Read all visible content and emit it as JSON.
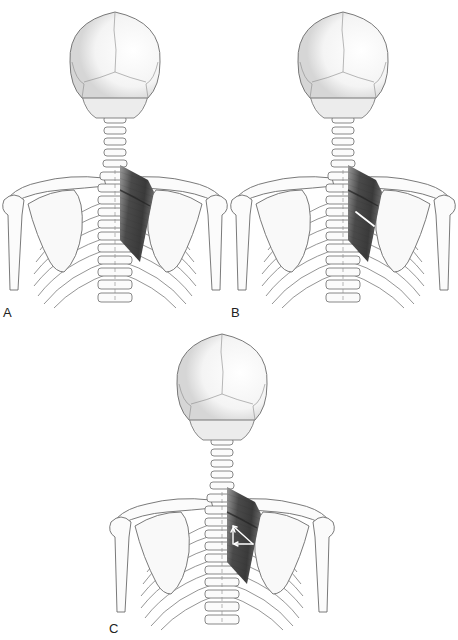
{
  "figure": {
    "panels": [
      {
        "id": "A",
        "label": "A",
        "overlay": "none"
      },
      {
        "id": "B",
        "label": "B",
        "overlay": "single-line-of-pull"
      },
      {
        "id": "C",
        "label": "C",
        "overlay": "force-vector-triangle"
      }
    ]
  },
  "colors": {
    "bone_outline": "#6b6b6b",
    "bone_fill": "#fbfbfb",
    "bone_shade": "#d9d9d9",
    "muscle_dark": "#3a3a3a",
    "muscle_mid": "#6f6f6f",
    "arrow": "#ffffff",
    "label": "#222222"
  }
}
